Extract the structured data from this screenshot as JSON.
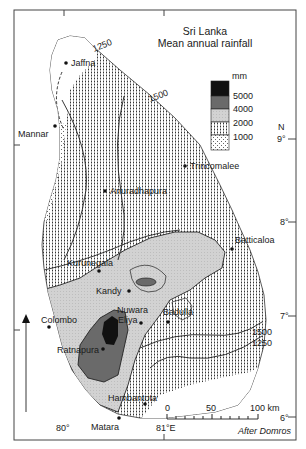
{
  "header_fragment": "",
  "map": {
    "title_line1": "Sri Lanka",
    "title_line2": "Mean annual rainfall",
    "legend": {
      "unit": "mm",
      "classes": [
        {
          "label": "5000",
          "color": "#111111",
          "meaning": "> 5000"
        },
        {
          "label": "4000",
          "color": "#6a6a6a",
          "meaning": "4000–5000"
        },
        {
          "label": "2000",
          "color": "#cfcfcf",
          "meaning": "2000–4000"
        },
        {
          "label": "1000",
          "color": "#ffffff",
          "meaning": "1000–2000 (vertical dot pattern)"
        },
        {
          "label": "",
          "color": "#ffffff",
          "meaning": "< 1000 (dotted pattern)"
        }
      ]
    },
    "isohyet_labels": [
      "1250",
      "1500",
      "1500",
      "1250"
    ],
    "cities": [
      {
        "name": "Jaffna"
      },
      {
        "name": "Mannar"
      },
      {
        "name": "Trincomalee"
      },
      {
        "name": "Anuradhapura"
      },
      {
        "name": "Batticaloa"
      },
      {
        "name": "Kurunegala"
      },
      {
        "name": "Kandy"
      },
      {
        "name": "Nuwara",
        "name2": "Eliya"
      },
      {
        "name": "Badulla"
      },
      {
        "name": "Colombo"
      },
      {
        "name": "Ratnapura"
      },
      {
        "name": "Hambantota"
      },
      {
        "name": "Matara"
      }
    ],
    "latitude_labels": {
      "n": "N",
      "lat9": "9°",
      "lat8": "8°",
      "lat7": "7°",
      "lat6": "6°"
    },
    "longitude_labels": {
      "lon80": "80°",
      "lon81": "81°E"
    },
    "scale_bar": {
      "tick0": "0",
      "tick50": "50",
      "tick100": "100 km"
    },
    "credit": "After Domros"
  }
}
